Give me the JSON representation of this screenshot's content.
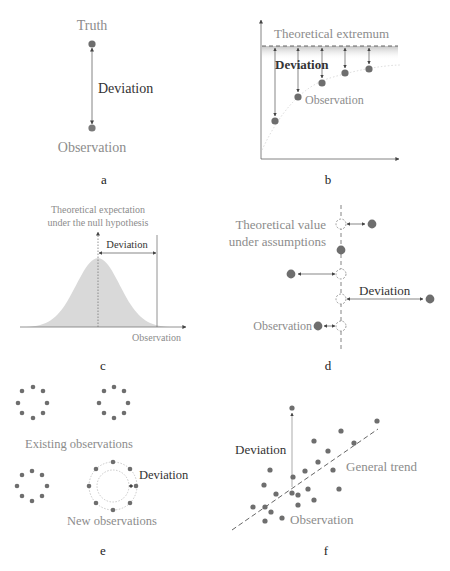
{
  "figure": {
    "colors": {
      "dot": "#6e6e6e",
      "text_dark": "#333333",
      "text_gray": "#8c8c8c",
      "fill_gray": "#d9d9d9",
      "line": "#555555"
    },
    "panels": {
      "a": {
        "letter": "a",
        "truth_label": "Truth",
        "deviation_label": "Deviation",
        "observation_label": "Observation"
      },
      "b": {
        "letter": "b",
        "extremum_label": "Theoretical extremum",
        "deviation_label": "Deviation",
        "observation_label": "Observation"
      },
      "c": {
        "letter": "c",
        "expectation_label_line1": "Theoretical expectation",
        "expectation_label_line2": "under the null hypothesis",
        "deviation_label": "Deviation",
        "observation_label": "Observation"
      },
      "d": {
        "letter": "d",
        "theoretical_label_line1": "Theoretical value",
        "theoretical_label_line2": "under assumptions",
        "deviation_label": "Deviation",
        "observation_label": "Observation"
      },
      "e": {
        "letter": "e",
        "existing_label": "Existing observations",
        "deviation_label": "Deviation",
        "new_label": "New observations"
      },
      "f": {
        "letter": "f",
        "deviation_label": "Deviation",
        "trend_label": "General trend",
        "observation_label": "Observation"
      }
    }
  }
}
